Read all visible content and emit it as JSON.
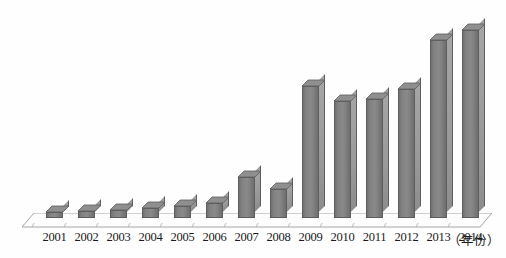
{
  "chart_data": {
    "type": "bar",
    "title": "",
    "subtitle": "",
    "xlabel": "（年份）",
    "ylabel": "",
    "categories": [
      "2001",
      "2002",
      "2003",
      "2004",
      "2005",
      "2006",
      "2007",
      "2008",
      "2009",
      "2010",
      "2011",
      "2012",
      "2013",
      "2014"
    ],
    "values": [
      6,
      7,
      8,
      10,
      12,
      15,
      42,
      30,
      136,
      121,
      123,
      133,
      183,
      194
    ],
    "series": [
      {
        "name": "数量",
        "values": [
          6,
          7,
          8,
          10,
          12,
          15,
          42,
          30,
          136,
          121,
          123,
          133,
          183,
          194
        ]
      }
    ],
    "ylim": [
      0,
      200
    ],
    "grid": false,
    "legend": null,
    "legend_position": "none",
    "style": "3d-column",
    "annotations": []
  },
  "axis": {
    "unit_label": "（年份）",
    "tick_labels": [
      "2001",
      "2002",
      "2003",
      "2004",
      "2005",
      "2006",
      "2007",
      "2008",
      "2009",
      "2010",
      "2011",
      "2012",
      "2013",
      "2014"
    ]
  },
  "colors": {
    "bar_front": "#7a7a7a",
    "bar_side": "#9a9a9a",
    "bar_top": "#8f8f8f",
    "bar_outline": "#5e5e5e",
    "floor_line": "#9b9b9b",
    "background": "#ffffff",
    "label_text": "#1b1b1b"
  }
}
